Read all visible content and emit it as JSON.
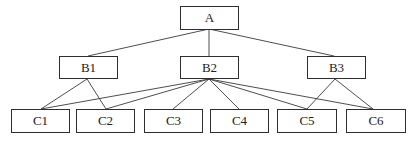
{
  "diagram": {
    "type": "hierarchy-tree",
    "levels": [
      [
        "A"
      ],
      [
        "B1",
        "B2",
        "B3"
      ],
      [
        "C1",
        "C2",
        "C3",
        "C4",
        "C5",
        "C6"
      ]
    ],
    "nodes": {
      "A": {
        "label": "A"
      },
      "B1": {
        "label": "B1"
      },
      "B2": {
        "label": "B2"
      },
      "B3": {
        "label": "B3"
      },
      "C1": {
        "label": "C1"
      },
      "C2": {
        "label": "C2"
      },
      "C3": {
        "label": "C3"
      },
      "C4": {
        "label": "C4"
      },
      "C5": {
        "label": "C5"
      },
      "C6": {
        "label": "C6"
      }
    },
    "edges": [
      [
        "A",
        "B1"
      ],
      [
        "A",
        "B2"
      ],
      [
        "A",
        "B3"
      ],
      [
        "B1",
        "C1"
      ],
      [
        "B1",
        "C2"
      ],
      [
        "B2",
        "C1"
      ],
      [
        "B2",
        "C2"
      ],
      [
        "B2",
        "C3"
      ],
      [
        "B2",
        "C4"
      ],
      [
        "B2",
        "C5"
      ],
      [
        "B2",
        "C6"
      ],
      [
        "B3",
        "C5"
      ],
      [
        "B3",
        "C6"
      ]
    ],
    "colors": {
      "line": "#3a3a3a",
      "border": "#2e2e2e",
      "text": "#222222",
      "background": "#ffffff"
    }
  }
}
